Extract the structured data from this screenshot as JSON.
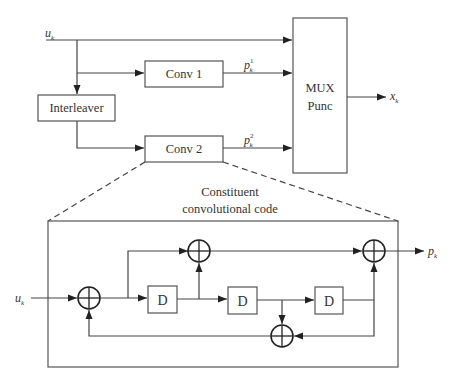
{
  "diagram": {
    "signals": {
      "input": {
        "base": "u",
        "sub": "k"
      },
      "parity1": {
        "base": "p",
        "sub": "k",
        "sup": "1"
      },
      "parity2": {
        "base": "p",
        "sub": "k",
        "sup": "2"
      },
      "output": {
        "base": "x",
        "sub": "k"
      },
      "constituent_input": {
        "base": "u",
        "sub": "k"
      },
      "constituent_output": {
        "base": "p",
        "sub": "k"
      }
    },
    "blocks": {
      "conv1": "Conv 1",
      "conv2": "Conv 2",
      "interleaver": "Interleaver",
      "mux_line1": "MUX",
      "mux_line2": "Punc"
    },
    "detail": {
      "caption_line1": "Constituent",
      "caption_line2": "convolutional code",
      "delay_label": "D",
      "delays": [
        "D",
        "D",
        "D"
      ],
      "xor_count": 4
    },
    "colors": {
      "stroke": "#444444",
      "box_stroke": "#555555",
      "text": "#333333",
      "background": "#ffffff"
    }
  }
}
